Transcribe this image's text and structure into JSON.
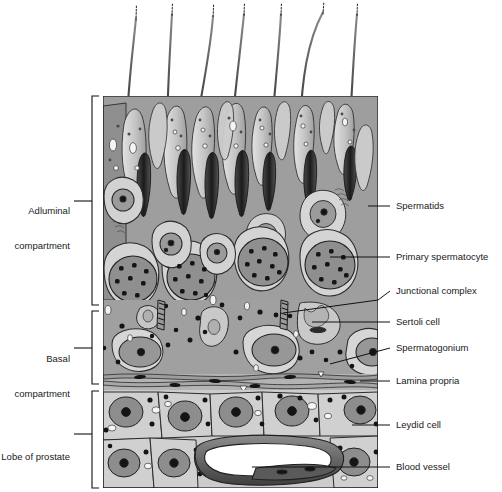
{
  "figure": {
    "type": "histology-diagram",
    "panel": {
      "x": 103,
      "y": 96,
      "width": 275,
      "height": 392
    }
  },
  "left_labels": [
    {
      "name": "adluminal-compartment",
      "text": "Adluminal\ncompartment",
      "line1": "Adluminal",
      "line2": "compartment",
      "x": 22,
      "y": 182,
      "bracket_top": 96,
      "bracket_bottom": 305,
      "bracket_x": 92
    },
    {
      "name": "basal-compartment",
      "text": "Basal\ncompartment",
      "line1": "Basal",
      "line2": "compartment",
      "x": 22,
      "y": 333,
      "bracket_top": 311,
      "bracket_bottom": 384,
      "bracket_x": 92
    },
    {
      "name": "lobe-of-prostate",
      "text": "Lobe of prostate",
      "line1": "Lobe of prostate",
      "line2": "",
      "x": 8,
      "y": 434,
      "bracket_top": 391,
      "bracket_bottom": 488,
      "bracket_x": 92
    }
  ],
  "right_labels": [
    {
      "name": "spermatids",
      "text": "Spermatids",
      "x": 396,
      "y": 206,
      "leader_from_x": 368,
      "leader_from_y": 206,
      "leader_to_x": 390,
      "leader_to_y": 206
    },
    {
      "name": "primary-spermatocyte",
      "text": "Primary spermatocyte",
      "x": 396,
      "y": 257,
      "leader_from_x": 330,
      "leader_from_y": 257,
      "leader_to_x": 390,
      "leader_to_y": 257
    },
    {
      "name": "junctional-complex",
      "text": "Junctional complex",
      "x": 396,
      "y": 291,
      "leader_from_x": 282,
      "leader_from_y": 312,
      "leader_to_x": 390,
      "leader_to_y": 291
    },
    {
      "name": "sertoli-cell",
      "text": "Sertoli cell",
      "x": 396,
      "y": 322,
      "leader_from_x": 310,
      "leader_from_y": 322,
      "leader_to_x": 390,
      "leader_to_y": 322
    },
    {
      "name": "spermatogonium",
      "text": "Spermatogonium",
      "x": 396,
      "y": 348,
      "leader_from_x": 330,
      "leader_from_y": 363,
      "leader_to_x": 390,
      "leader_to_y": 348
    },
    {
      "name": "lamina-propria",
      "text": "Lamina propria",
      "x": 396,
      "y": 381,
      "leader_from_x": 360,
      "leader_from_y": 381,
      "leader_to_x": 390,
      "leader_to_y": 381
    },
    {
      "name": "leydig-cell",
      "text": "Leydid cell",
      "x": 396,
      "y": 425,
      "leader_from_x": 352,
      "leader_from_y": 425,
      "leader_to_x": 390,
      "leader_to_y": 425
    },
    {
      "name": "blood-vessel",
      "text": "Blood vessel",
      "x": 396,
      "y": 467,
      "leader_from_x": 250,
      "leader_from_y": 467,
      "leader_to_x": 390,
      "leader_to_y": 467
    }
  ],
  "colors": {
    "ink": "#111111",
    "outline": "#2b2b2b",
    "background": "#ffffff",
    "cytoplasm_light": "#d8d8d8",
    "cytoplasm_mid": "#b8b8b8",
    "sertoli_cytoplasm": "#9e9e9e",
    "nucleus_mid": "#a5a5a5",
    "nucleus_dark": "#7d7d7d",
    "chromatin": "#141414",
    "vacuole": "#f2f2f2",
    "lamina_band": "#b0b0b0",
    "prostate_cell": "#cfcfcf",
    "vessel_lumen": "#ffffff",
    "vessel_wall": "#6f6f6f",
    "tail": "#3a3a3a"
  },
  "structures": {
    "spermatid_tails": 7,
    "elongated_spermatids": 12,
    "primary_spermatocytes": 6,
    "spermatogonia": 3,
    "sertoli_cells": 2,
    "junctional_complexes": 2,
    "leydig_cells": 11,
    "blood_vessels": 1
  }
}
